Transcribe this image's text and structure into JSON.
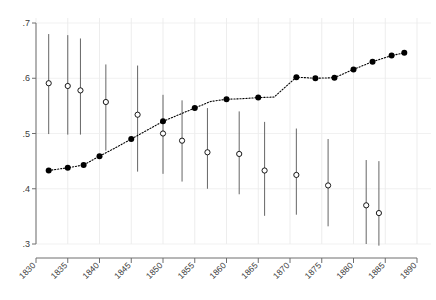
{
  "chart_data": {
    "type": "scatter",
    "title": "",
    "subtitle": "",
    "xlabel": "",
    "ylabel": "",
    "xlim": [
      1830,
      1890
    ],
    "ylim": [
      0.3,
      0.7
    ],
    "grid": true,
    "grid_style": "light dotted vertical and horizontal gridlines",
    "legend": null,
    "y_ticks": [
      ".3",
      ".4",
      ".5",
      ".6",
      ".7"
    ],
    "y_tick_values": [
      0.3,
      0.4,
      0.5,
      0.6,
      0.7
    ],
    "x_ticks": [
      "1830",
      "1835",
      "1840",
      "1845",
      "1850",
      "1855",
      "1860",
      "1865",
      "1870",
      "1875",
      "1880",
      "1885",
      "1890"
    ],
    "x_tick_values": [
      1830,
      1835,
      1840,
      1845,
      1850,
      1855,
      1860,
      1865,
      1870,
      1875,
      1880,
      1885,
      1890
    ],
    "series": [
      {
        "name": "solid-series",
        "marker": "filled-circle",
        "line": "dotted",
        "color": "#000000",
        "has_error_bars": false,
        "x": [
          1832,
          1835,
          1837.5,
          1840,
          1842.5,
          1845,
          1847.5,
          1850,
          1852.5,
          1855,
          1857.5,
          1860,
          1862.5,
          1865,
          1867.5,
          1871,
          1874,
          1877,
          1880,
          1883,
          1886,
          1888
        ],
        "values": [
          0.433,
          0.438,
          0.443,
          0.459,
          0.474,
          0.49,
          0.506,
          0.522,
          0.534,
          0.546,
          0.558,
          0.562,
          0.563,
          0.565,
          0.566,
          0.602,
          0.6,
          0.601,
          0.616,
          0.63,
          0.641,
          0.646
        ]
      },
      {
        "name": "hollow-series",
        "marker": "open-circle",
        "line": "none",
        "color": "#000000",
        "has_error_bars": true,
        "points": [
          {
            "x": 1832,
            "y": 0.591,
            "lo": 0.499,
            "hi": 0.68
          },
          {
            "x": 1835,
            "y": 0.586,
            "lo": 0.498,
            "hi": 0.678
          },
          {
            "x": 1837,
            "y": 0.578,
            "lo": 0.498,
            "hi": 0.672
          },
          {
            "x": 1841,
            "y": 0.557,
            "lo": 0.469,
            "hi": 0.625
          },
          {
            "x": 1846,
            "y": 0.534,
            "lo": 0.431,
            "hi": 0.623
          },
          {
            "x": 1850,
            "y": 0.5,
            "lo": 0.427,
            "hi": 0.57
          },
          {
            "x": 1853,
            "y": 0.487,
            "lo": 0.413,
            "hi": 0.56
          },
          {
            "x": 1857,
            "y": 0.466,
            "lo": 0.4,
            "hi": 0.546
          },
          {
            "x": 1862,
            "y": 0.463,
            "lo": 0.39,
            "hi": 0.54
          },
          {
            "x": 1866,
            "y": 0.433,
            "lo": 0.351,
            "hi": 0.521
          },
          {
            "x": 1871,
            "y": 0.425,
            "lo": 0.353,
            "hi": 0.509
          },
          {
            "x": 1876,
            "y": 0.406,
            "lo": 0.332,
            "hi": 0.49
          },
          {
            "x": 1882,
            "y": 0.37,
            "lo": 0.3,
            "hi": 0.452
          },
          {
            "x": 1884,
            "y": 0.356,
            "lo": 0.297,
            "hi": 0.45
          }
        ]
      }
    ]
  }
}
